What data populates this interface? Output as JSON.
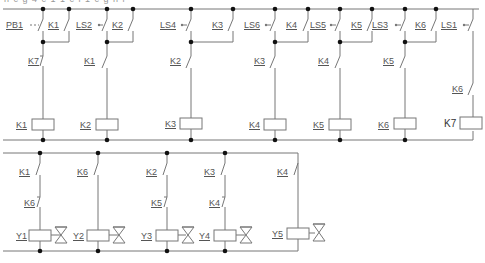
{
  "caption": "n c g 4 c 1 1 c l 1 c g n i",
  "top_circuit": {
    "rungs": [
      {
        "switch_label": "PB1",
        "switch_type": "pushbutton-no",
        "holding_contact": "K1",
        "interlock": "K7",
        "interlock_type": "nc",
        "coil": "K1"
      },
      {
        "switch_label": "LS2",
        "switch_type": "limit-switch-no",
        "holding_contact": "K2",
        "interlock": "K1",
        "interlock_type": "no",
        "coil": "K2"
      },
      {
        "switch_label": "LS4",
        "switch_type": "limit-switch-no",
        "holding_contact": "K3",
        "interlock": "K2",
        "interlock_type": "no",
        "coil": "K3"
      },
      {
        "switch_label": "LS6",
        "switch_type": "limit-switch-no",
        "holding_contact": "K4",
        "interlock": "K3",
        "interlock_type": "no",
        "coil": "K4"
      },
      {
        "switch_label": "LS5",
        "switch_type": "limit-switch-no",
        "holding_contact": "K5",
        "interlock": "K4",
        "interlock_type": "no",
        "coil": "K5"
      },
      {
        "switch_label": "LS3",
        "switch_type": "limit-switch-no",
        "holding_contact": "K6",
        "interlock": "K5",
        "interlock_type": "no",
        "coil": "K6"
      },
      {
        "switch_label": "LS1",
        "switch_type": "limit-switch-no",
        "holding_contact": null,
        "interlock": "K6",
        "interlock_type": "no",
        "coil": "K7"
      }
    ]
  },
  "bottom_circuit": {
    "rungs": [
      {
        "contact1": "K1",
        "contact2": "K6",
        "contact2_type": "nc",
        "coil": "Y1"
      },
      {
        "contact1": "K6",
        "contact2": null,
        "coil": "Y2"
      },
      {
        "contact1": "K2",
        "contact2": "K5",
        "contact2_type": "nc",
        "coil": "Y3"
      },
      {
        "contact1": "K3",
        "contact2": "K4",
        "contact2_type": "nc",
        "coil": "Y4"
      },
      {
        "contact1": "K4",
        "contact2": null,
        "coil": "Y5"
      }
    ]
  },
  "labels": {
    "pb1": "PB1",
    "k1_hold": "K1",
    "ls2": "LS2",
    "k2_hold": "K2",
    "ls4": "LS4",
    "k3_hold": "K3",
    "ls6": "LS6",
    "k4_hold": "K4",
    "ls5": "LS5",
    "k5_hold": "K5",
    "ls3": "LS3",
    "k6_hold": "K6",
    "ls1": "LS1",
    "k7_nc": "K7",
    "k1_no": "K1",
    "k2_no": "K2",
    "k3_no": "K3",
    "k4_no": "K4",
    "k5_no": "K5",
    "k6_no": "K6",
    "coil_k1": "K1",
    "coil_k2": "K2",
    "coil_k3": "K3",
    "coil_k4": "K4",
    "coil_k5": "K5",
    "coil_k6": "K6",
    "coil_k7": "K7",
    "b_k1": "K1",
    "b_k6a": "K6",
    "b_k2": "K2",
    "b_k3": "K3",
    "b_k4": "K4",
    "b_k6b": "K6",
    "b_k5": "K5",
    "b_k4b": "K4",
    "y1": "Y1",
    "y2": "Y2",
    "y3": "Y3",
    "y4": "Y4",
    "y5": "Y5"
  }
}
